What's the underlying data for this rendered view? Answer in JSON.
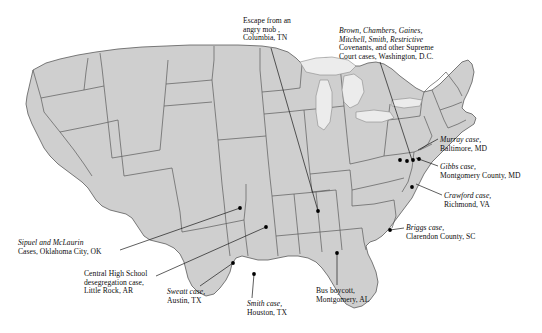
{
  "map": {
    "title": "Civil rights cases and events across the United States",
    "region": "United States",
    "colors": {
      "land_fill": "#cfcfcf",
      "land_stroke": "#5a5a5a",
      "lake_fill": "#ececec",
      "background": "#ffffff",
      "marker": "#000000",
      "leader_line": "#1a1a1a",
      "text": "#0d0d0d"
    },
    "markers": [
      {
        "name": "columbia-tn",
        "x": 318,
        "y": 211
      },
      {
        "name": "oklahoma-city-ok",
        "x": 240,
        "y": 208
      },
      {
        "name": "little-rock-ar",
        "x": 266,
        "y": 227
      },
      {
        "name": "austin-tx",
        "x": 233,
        "y": 263
      },
      {
        "name": "houston-tx",
        "x": 254,
        "y": 274
      },
      {
        "name": "montgomery-al",
        "x": 337,
        "y": 253
      },
      {
        "name": "clarendon-county-sc",
        "x": 390,
        "y": 230
      },
      {
        "name": "richmond-va",
        "x": 412,
        "y": 187
      },
      {
        "name": "montgomery-county-md",
        "x": 406,
        "y": 166
      },
      {
        "name": "baltimore-md",
        "x": 412,
        "y": 161
      },
      {
        "name": "washington-dc",
        "x": 408,
        "y": 163
      },
      {
        "name": "washington-dc-cluster-a",
        "x": 398,
        "y": 160
      },
      {
        "name": "washington-dc-cluster-b",
        "x": 418,
        "y": 160
      }
    ],
    "labels": [
      {
        "name": "escape-angry-mob-columbia-tn",
        "id": "lbl-columbia",
        "x": 243,
        "y": 17,
        "align": "left",
        "lines": [
          {
            "text": "Escape from an",
            "italic": false
          },
          {
            "text": "angry mob ,",
            "italic": false
          },
          {
            "text": "Columbia, TN",
            "italic": false
          }
        ]
      },
      {
        "name": "supreme-court-cases-washington-dc",
        "id": "lbl-scotus",
        "x": 339,
        "y": 27,
        "align": "left",
        "lines": [
          {
            "text": "Brown, Chambers, Gaines,",
            "italic": true
          },
          {
            "text": "Mitchell, Smith, Restrictive",
            "italic": true
          },
          {
            "text": "Covenants, and other Supreme",
            "italic": false
          },
          {
            "text": "Court cases, Washington, D.C.",
            "italic": false
          }
        ]
      },
      {
        "name": "murray-case-baltimore-md",
        "id": "lbl-murray",
        "x": 440,
        "y": 136,
        "align": "left",
        "lines": [
          {
            "text": "Murray case,",
            "italic": true
          },
          {
            "text": "Baltimore, MD",
            "italic": false
          }
        ]
      },
      {
        "name": "gibbs-case-montgomery-county-md",
        "id": "lbl-gibbs",
        "x": 440,
        "y": 163,
        "align": "left",
        "lines": [
          {
            "text": "Gibbs case,",
            "italic": true
          },
          {
            "text": "Montgomery County, MD",
            "italic": false
          }
        ]
      },
      {
        "name": "crawford-case-richmond-va",
        "id": "lbl-crawford",
        "x": 444,
        "y": 192,
        "align": "left",
        "lines": [
          {
            "text": "Crawford case,",
            "italic": true
          },
          {
            "text": "Richmond, VA",
            "italic": false
          }
        ]
      },
      {
        "name": "briggs-case-clarendon-county-sc",
        "id": "lbl-briggs",
        "x": 406,
        "y": 224,
        "align": "left",
        "lines": [
          {
            "text": "Briggs case,",
            "italic": true
          },
          {
            "text": "Clarendon County, SC",
            "italic": false
          }
        ]
      },
      {
        "name": "sipuel-mclaurin-cases-oklahoma-city-ok",
        "id": "lbl-sipuel",
        "x": 18,
        "y": 239,
        "align": "left",
        "lines": [
          {
            "text": "Sipuel and McLaurin",
            "italic": true
          },
          {
            "text": "Cases, Oklahoma City, OK",
            "italic": false
          }
        ]
      },
      {
        "name": "central-high-school-little-rock-ar",
        "id": "lbl-centralhigh",
        "x": 84,
        "y": 270,
        "align": "left",
        "lines": [
          {
            "text": "Central High School",
            "italic": false
          },
          {
            "text": "desegregation case,",
            "italic": false
          },
          {
            "text": "Little Rock, AR",
            "italic": false
          }
        ]
      },
      {
        "name": "sweatt-case-austin-tx",
        "id": "lbl-sweatt",
        "x": 167,
        "y": 288,
        "align": "left",
        "lines": [
          {
            "text": "Sweatt case,",
            "italic": true
          },
          {
            "text": "Austin, TX",
            "italic": false
          }
        ]
      },
      {
        "name": "smith-case-houston-tx",
        "id": "lbl-smith",
        "x": 247,
        "y": 300,
        "align": "left",
        "lines": [
          {
            "text": "Smith case,",
            "italic": true
          },
          {
            "text": "Houston, TX",
            "italic": false
          }
        ]
      },
      {
        "name": "bus-boycott-montgomery-al",
        "id": "lbl-busboycott",
        "x": 316,
        "y": 287,
        "align": "left",
        "lines": [
          {
            "text": "Bus boycott,",
            "italic": false
          },
          {
            "text": "Montgomery, AL",
            "italic": false
          }
        ]
      }
    ]
  }
}
